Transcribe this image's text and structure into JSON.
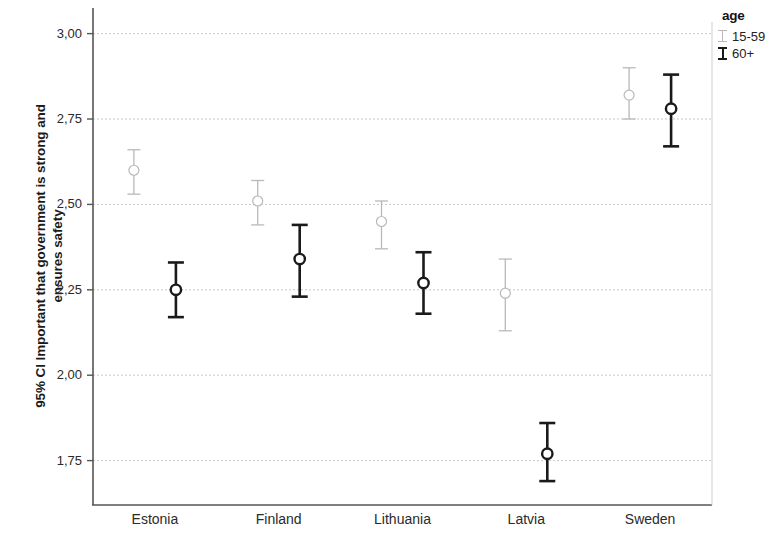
{
  "chart_data": {
    "type": "scatter",
    "title": "",
    "xlabel": "",
    "ylabel": "95% CI Important that government is strong and ensures safety",
    "ylabel_line1": "95% CI Important that government is strong and",
    "ylabel_line2": "ensures safety",
    "categories": [
      "Estonia",
      "Finland",
      "Lithuania",
      "Latvia",
      "Sweden"
    ],
    "ylim": [
      1.62,
      3.07
    ],
    "yticks": [
      3.0,
      2.75,
      2.5,
      2.25,
      2.0,
      1.75
    ],
    "ytick_labels": [
      "3,00",
      "2,75",
      "2,50",
      "2,25",
      "2,00",
      "1,75"
    ],
    "grid": true,
    "grid_axis": "y",
    "legend": {
      "title": "age",
      "position": "right",
      "entries": [
        {
          "label": "15-59",
          "color": "#b9b9b9"
        },
        {
          "label": "60+",
          "color": "#1a1a1a"
        }
      ]
    },
    "error_bar_style": "95% CI with circle marker and caps",
    "series": [
      {
        "name": "15-59",
        "color": "#b9b9b9",
        "values": [
          2.6,
          2.51,
          2.45,
          2.24,
          2.82
        ],
        "ci_lower": [
          2.53,
          2.44,
          2.37,
          2.13,
          2.75
        ],
        "ci_upper": [
          2.66,
          2.57,
          2.51,
          2.34,
          2.9
        ]
      },
      {
        "name": "60+",
        "color": "#1a1a1a",
        "values": [
          2.25,
          2.34,
          2.27,
          1.77,
          2.78
        ],
        "ci_lower": [
          2.17,
          2.23,
          2.18,
          1.69,
          2.67
        ],
        "ci_upper": [
          2.33,
          2.44,
          2.36,
          1.86,
          2.88
        ]
      }
    ]
  },
  "axis_geometry": {
    "plot_left": 93,
    "plot_right": 712,
    "plot_top": 8,
    "plot_bottom": 505,
    "y_top_value": 3.075,
    "y_bottom_value": 1.62,
    "group_offset": 42
  }
}
